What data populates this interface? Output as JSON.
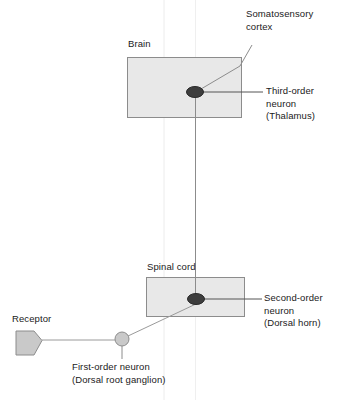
{
  "diagram": {
    "colors": {
      "box_fill": "#e8e8e8",
      "box_stroke": "#8c8c8c",
      "neuron_dark": "#3d3d3d",
      "neuron_light": "#c9c9c9",
      "connector": "#8c8c8c",
      "guide": "#e4e4e4",
      "text": "#1a1a1a"
    },
    "structures": {
      "brain_label": "Brain",
      "spinal_cord_label": "Spinal cord",
      "receptor_label": "Receptor"
    },
    "callouts": {
      "somatosensory_cortex": "Somatosensory\ncortex",
      "third_order_neuron": "Third-order\nneuron\n(Thalamus)",
      "second_order_neuron": "Second-order\nneuron\n(Dorsal horn)",
      "first_order_neuron": "First-order neuron\n(Dorsal root ganglion)"
    },
    "nodes": [
      {
        "name": "third-order-neuron",
        "shape": "ellipse",
        "fill": "#3d3d3d",
        "cx": 195,
        "cy": 92,
        "rx": 8.5,
        "ry": 5.5
      },
      {
        "name": "second-order-neuron",
        "shape": "ellipse",
        "fill": "#3d3d3d",
        "cx": 196,
        "cy": 299,
        "rx": 8.5,
        "ry": 5.5
      },
      {
        "name": "first-order-neuron",
        "shape": "circle",
        "fill": "#c9c9c9",
        "cx": 122,
        "cy": 339,
        "r": 7
      },
      {
        "name": "receptor",
        "shape": "pentagon",
        "fill": "#c9c9c9",
        "x": 15,
        "y": 330,
        "width": 27,
        "height": 25
      }
    ],
    "regions": [
      {
        "name": "brain-box",
        "x": 127,
        "y": 57,
        "width": 115,
        "height": 61
      },
      {
        "name": "spinal-cord-box",
        "x": 146,
        "y": 277,
        "width": 99,
        "height": 40
      }
    ]
  }
}
